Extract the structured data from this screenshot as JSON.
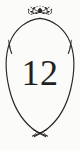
{
  "card": {
    "background_color": "#fbfbf9",
    "ink_color": "#231f20",
    "width": 80,
    "height": 150
  },
  "number": {
    "value": "12",
    "color": "#231f20",
    "font_style": "serif"
  },
  "frame": {
    "shape_name": "pointed-oval-vesica",
    "stroke_color": "#2a2522",
    "stroke_width": 1.1,
    "top_apex_y": 18,
    "bottom_crossing_y": 133,
    "widest_left_x": 7,
    "widest_right_x": 73
  },
  "ornaments": {
    "top": {
      "name": "floral-flourish-ornament",
      "color": "#2a2522",
      "center_x": 40,
      "center_y": 11
    },
    "bottom": {
      "name": "crossed-tails-ornament",
      "color": "#2a2522",
      "center_x": 40,
      "center_y": 134
    },
    "left_spur": {
      "name": "left-barb-spur",
      "color": "#2a2522"
    },
    "right_spur": {
      "name": "right-barb-spur",
      "color": "#2a2522"
    }
  }
}
